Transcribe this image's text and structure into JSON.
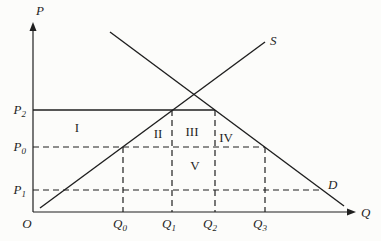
{
  "figure": {
    "type": "supply-demand-diagram",
    "background_color": "#fcfcfa",
    "line_color": "#1f1f1f",
    "axes": {
      "y_axis_label": "P",
      "x_axis_label": "Q",
      "origin_label": "O"
    },
    "curves": {
      "supply_label": "S",
      "demand_label": "D"
    },
    "price_levels": {
      "p2": {
        "main": "P",
        "sub": "2",
        "line_style": "solid"
      },
      "p0": {
        "main": "P",
        "sub": "0",
        "line_style": "dashed"
      },
      "p1": {
        "main": "P",
        "sub": "1",
        "line_style": "dashed"
      }
    },
    "quantity_levels": {
      "q0": {
        "main": "Q",
        "sub": "0"
      },
      "q1": {
        "main": "Q",
        "sub": "1"
      },
      "q2": {
        "main": "Q",
        "sub": "2"
      },
      "q3": {
        "main": "Q",
        "sub": "3"
      }
    },
    "regions": {
      "r1": "I",
      "r2": "II",
      "r3": "III",
      "r4": "IV",
      "r5": "V"
    }
  }
}
